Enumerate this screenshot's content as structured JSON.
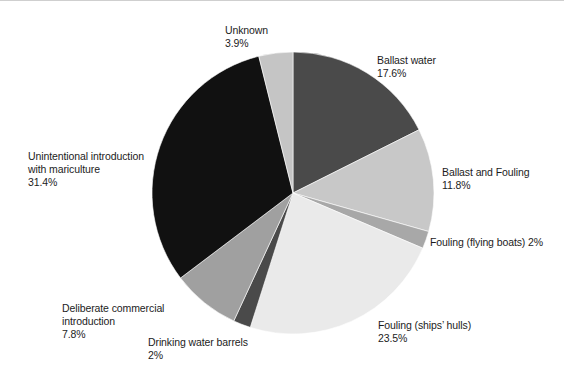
{
  "figure": {
    "background_color": "#ffffff",
    "text_color": "#1c1c1c"
  },
  "chart_data": {
    "type": "pie",
    "title": "",
    "subtitle": "",
    "xlabel": "",
    "ylabel": "",
    "grid": false,
    "legend_position": "none",
    "labels_position": "outside-callout",
    "start_angle_deg": 0,
    "direction": "clockwise",
    "center": {
      "x": 293,
      "y": 192
    },
    "radius": 141,
    "categories": [
      "Ballast water",
      "Ballast and Fouling",
      "Fouling (flying boats)",
      "Fouling (ships’ hulls)",
      "Drinking water barrels",
      "Deliberate commercial introduction",
      "Unintentional introduction with mariculture",
      "Unknown"
    ],
    "values": [
      17.6,
      11.8,
      2,
      23.5,
      2,
      7.8,
      31.4,
      3.9
    ],
    "value_labels": [
      "17.6%",
      "11.8%",
      "2%",
      "23.5%",
      "2%",
      "7.8%",
      "31.4%",
      "3.9%"
    ],
    "colors": [
      "#4a4a4a",
      "#c8c8c8",
      "#a8a8a8",
      "#eaeaea",
      "#4a4a4a",
      "#a0a0a0",
      "#111111",
      "#c5c5c5"
    ],
    "slices": [
      {
        "name": "Ballast water",
        "value": 17.6,
        "value_label": "17.6%",
        "color": "#4a4a4a"
      },
      {
        "name": "Ballast and Fouling",
        "value": 11.8,
        "value_label": "11.8%",
        "color": "#c8c8c8"
      },
      {
        "name": "Fouling (flying boats)",
        "value": 2,
        "value_label": "2%",
        "color": "#a8a8a8"
      },
      {
        "name": "Fouling (ships’ hulls)",
        "value": 23.5,
        "value_label": "23.5%",
        "color": "#eaeaea"
      },
      {
        "name": "Drinking water barrels",
        "value": 2,
        "value_label": "2%",
        "color": "#4a4a4a"
      },
      {
        "name": "Deliberate commercial introduction",
        "value": 7.8,
        "value_label": "7.8%",
        "color": "#a0a0a0"
      },
      {
        "name": "Unintentional introduction with mariculture",
        "value": 31.4,
        "value_label": "31.4%",
        "color": "#111111"
      },
      {
        "name": "Unknown",
        "value": 3.9,
        "value_label": "3.9%",
        "color": "#c5c5c5"
      }
    ]
  },
  "labels": {
    "unknown": {
      "name": "Unknown",
      "value": "3.9%"
    },
    "ballast_water": {
      "name": "Ballast water",
      "value": "17.6%"
    },
    "ballast_and_fouling": {
      "name": "Ballast and Fouling",
      "value": "11.8%"
    },
    "fouling_flying": {
      "name": "Fouling (flying boats) 2%",
      "value": ""
    },
    "fouling_hulls": {
      "name": "Fouling (ships’ hulls)",
      "value": "23.5%"
    },
    "drinking_water": {
      "name": "Drinking water barrels",
      "value": "2%"
    },
    "deliberate": {
      "name": "Deliberate commercial\nintroduction",
      "value": "7.8%"
    },
    "mariculture": {
      "name": "Unintentional introduction\nwith mariculture",
      "value": "31.4%"
    }
  }
}
